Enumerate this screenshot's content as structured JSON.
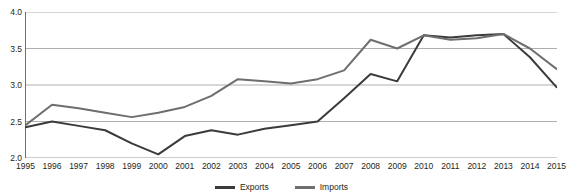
{
  "chart_data": {
    "type": "line",
    "title": "",
    "xlabel": "",
    "ylabel": "",
    "ylim": [
      2.0,
      4.0
    ],
    "ytick_step": 0.5,
    "grid": true,
    "legend_position": "bottom-center",
    "x": [
      1995,
      1996,
      1997,
      1998,
      1999,
      2000,
      2001,
      2002,
      2003,
      2004,
      2005,
      2006,
      2007,
      2008,
      2009,
      2010,
      2011,
      2012,
      2013,
      2014,
      2015
    ],
    "categories": [
      "1995",
      "1996",
      "1997",
      "1998",
      "1999",
      "2000",
      "2001",
      "2002",
      "2003",
      "2004",
      "2005",
      "2006",
      "2007",
      "2008",
      "2009",
      "2010",
      "2011",
      "2012",
      "2013",
      "2014",
      "2015"
    ],
    "ytick_labels": [
      "4.0",
      "3.5",
      "3.0",
      "2.5",
      "2.0"
    ],
    "ytick_values": [
      4.0,
      3.5,
      3.0,
      2.5,
      2.0
    ],
    "series": [
      {
        "name": "Exports",
        "color": "#3b3b3b",
        "values": [
          2.42,
          2.5,
          2.44,
          2.38,
          2.2,
          2.05,
          2.3,
          2.38,
          2.32,
          2.4,
          2.45,
          2.5,
          2.82,
          3.15,
          3.05,
          3.68,
          3.65,
          3.68,
          3.7,
          3.38,
          2.97
        ]
      },
      {
        "name": "Imports",
        "color": "#6e6e6e",
        "values": [
          2.45,
          2.73,
          2.68,
          2.62,
          2.56,
          2.62,
          2.7,
          2.85,
          3.08,
          3.05,
          3.02,
          3.08,
          3.2,
          3.62,
          3.5,
          3.68,
          3.62,
          3.64,
          3.7,
          3.5,
          3.22
        ]
      }
    ]
  },
  "legend": {
    "entries": [
      {
        "label": "Exports",
        "color": "#3b3b3b"
      },
      {
        "label": "Imports",
        "color": "#6e6e6e"
      }
    ]
  },
  "axes": {
    "axis_color": "#6d6e70",
    "grid_color": "#9b9b9b"
  }
}
